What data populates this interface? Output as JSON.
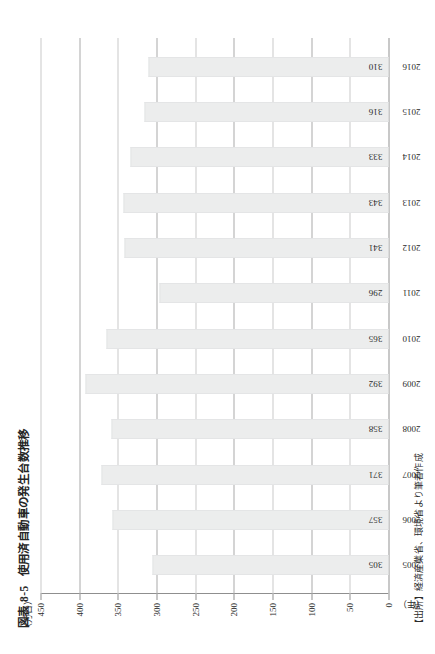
{
  "figure": {
    "number": "図表 8-5",
    "title": "使用済自動車の発生台数推移",
    "source_note": "【出所】経済産業省、環境省より筆者作成"
  },
  "chart_data": {
    "type": "bar",
    "title": "使用済自動車の発生台数推移",
    "xlabel": "（年）",
    "ylabel": "（万台）",
    "ylim": [
      0,
      450
    ],
    "ytick_step": 50,
    "yticks": [
      0,
      50,
      100,
      150,
      200,
      250,
      300,
      350,
      400,
      450
    ],
    "ytick_labels": [
      "0",
      "50",
      "100",
      "150",
      "200",
      "250",
      "300",
      "350",
      "400",
      "450"
    ],
    "grid": true,
    "legend": "none",
    "categories": [
      "2005",
      "2006",
      "2007",
      "2008",
      "2009",
      "2010",
      "2011",
      "2012",
      "2013",
      "2014",
      "2015",
      "2016"
    ],
    "values": [
      305,
      357,
      371,
      358,
      392,
      365,
      296,
      341,
      343,
      333,
      316,
      310
    ],
    "data_labels": [
      "305",
      "357",
      "371",
      "358",
      "392",
      "365",
      "296",
      "341",
      "343",
      "333",
      "316",
      "310"
    ],
    "bar_color": "#eceded",
    "bar_border_color": "#e4e5e6",
    "axis_color": "#8f8f8f",
    "gridline_color": "#a9a9a9"
  }
}
